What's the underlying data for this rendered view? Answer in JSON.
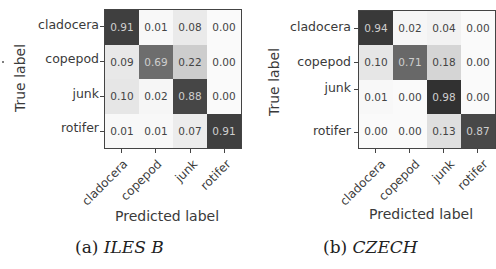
{
  "chart_data": [
    {
      "type": "heatmap",
      "title": "",
      "caption_prefix": "(a)",
      "caption_name": "ILES B",
      "xlabel": "Predicted label",
      "ylabel": "True label",
      "row_labels": [
        "cladocera",
        "copepod",
        "junk",
        "rotifer"
      ],
      "col_labels": [
        "cladocera",
        "copepod",
        "junk",
        "rotifer"
      ],
      "values": [
        [
          0.91,
          0.01,
          0.08,
          0.0
        ],
        [
          0.09,
          0.69,
          0.22,
          0.0
        ],
        [
          0.1,
          0.02,
          0.88,
          0.0
        ],
        [
          0.01,
          0.01,
          0.07,
          0.91
        ]
      ],
      "value_labels": [
        [
          "0.91",
          "0.01",
          "0.08",
          "0.00"
        ],
        [
          "0.09",
          "0.69",
          "0.22",
          "0.00"
        ],
        [
          "0.10",
          "0.02",
          "0.88",
          "0.00"
        ],
        [
          "0.01",
          "0.01",
          "0.07",
          "0.91"
        ]
      ],
      "colormap": "greys",
      "vrange": [
        0,
        1
      ]
    },
    {
      "type": "heatmap",
      "title": "",
      "caption_prefix": "(b)",
      "caption_name": "CZECH",
      "xlabel": "Predicted label",
      "ylabel": "True label",
      "row_labels": [
        "cladocera",
        "copepod",
        "junk",
        "rotifer"
      ],
      "col_labels": [
        "cladocera",
        "copepod",
        "junk",
        "rotifer"
      ],
      "values": [
        [
          0.94,
          0.02,
          0.04,
          0.0
        ],
        [
          0.1,
          0.71,
          0.18,
          0.0
        ],
        [
          0.01,
          0.0,
          0.98,
          0.0
        ],
        [
          0.0,
          0.0,
          0.13,
          0.87
        ]
      ],
      "value_labels": [
        [
          "0.94",
          "0.02",
          "0.04",
          "0.00"
        ],
        [
          "0.10",
          "0.71",
          "0.18",
          "0.00"
        ],
        [
          "0.01",
          "0.00",
          "0.98",
          "0.00"
        ],
        [
          "0.00",
          "0.00",
          "0.13",
          "0.87"
        ]
      ],
      "colormap": "greys",
      "vrange": [
        0,
        1
      ]
    }
  ]
}
